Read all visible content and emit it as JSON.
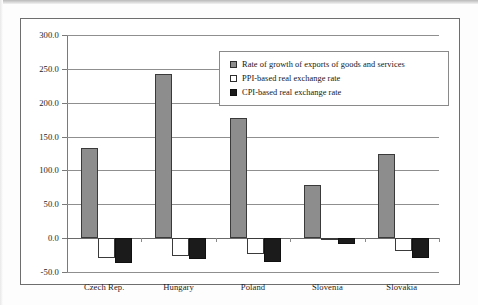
{
  "figure": {
    "background_color": "#ffffff",
    "border_color": "#6e6e6e"
  },
  "legend": {
    "position": "inside-top-center",
    "entries": [
      {
        "marker": "filled-gray-square",
        "label": "Rate of growth of exports of goods and services",
        "color": "#8d8d8d"
      },
      {
        "marker": "open-white-square",
        "label": "PPI-based real exchange rate",
        "color": "#ffffff"
      },
      {
        "marker": "filled-black-square",
        "label": "CPI-based real exchange rate",
        "color": "#1b1b1b"
      }
    ]
  },
  "axes": {
    "y_tick_labels": [
      "300.0",
      "250.0",
      "200.0",
      "150.0",
      "100.0",
      "50.0",
      "0.0",
      "-50.0"
    ],
    "y_tick_values": [
      300,
      250,
      200,
      150,
      100,
      50,
      0,
      -50
    ],
    "x_tick_labels": [
      "Czech Rep.",
      "Hungary",
      "Poland",
      "Slovenia",
      "Slovakia"
    ]
  },
  "chart_data": {
    "type": "bar",
    "title": "",
    "xlabel": "",
    "ylabel": "",
    "ylim": [
      -50,
      300
    ],
    "ytick_step": 50,
    "grid": true,
    "legend_position": "inside-top-center",
    "categories": [
      "Czech Rep.",
      "Hungary",
      "Poland",
      "Slovenia",
      "Slovakia"
    ],
    "series": [
      {
        "name": "Rate of growth of exports of goods and services",
        "color": "#8d8d8d",
        "values": [
          133,
          243,
          178,
          79,
          125
        ]
      },
      {
        "name": "PPI-based real exchange rate",
        "color": "#ffffff",
        "values": [
          -29,
          -27,
          -23,
          -3,
          -19
        ]
      },
      {
        "name": "CPI-based real exchange rate",
        "color": "#1b1b1b",
        "values": [
          -37,
          -31,
          -35,
          -9,
          -29
        ]
      }
    ]
  }
}
